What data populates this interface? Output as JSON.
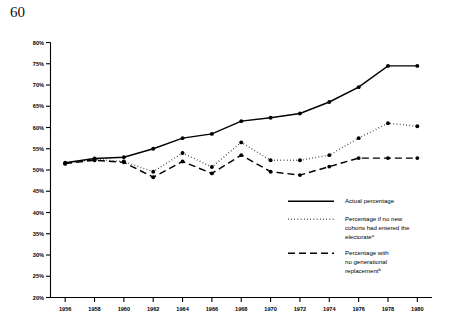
{
  "page": {
    "number": "60"
  },
  "chart_data": {
    "type": "line",
    "title": "",
    "xlabel": "",
    "ylabel": "",
    "x": [
      1956,
      1958,
      1960,
      1962,
      1964,
      1966,
      1968,
      1970,
      1972,
      1974,
      1976,
      1978,
      1980
    ],
    "categories": [
      "1956",
      "1958",
      "1960",
      "1962",
      "1964",
      "1966",
      "1968",
      "1970",
      "1972",
      "1974",
      "1976",
      "1978",
      "1980"
    ],
    "xlim": [
      1955,
      1981
    ],
    "ylim": [
      20,
      80
    ],
    "ytick_labels": [
      "20%",
      "25%",
      "30%",
      "35%",
      "40%",
      "45%",
      "50%",
      "55%",
      "60%",
      "65%",
      "70%",
      "75%",
      "80%"
    ],
    "ytick_values": [
      20,
      25,
      30,
      35,
      40,
      45,
      50,
      55,
      60,
      65,
      70,
      75,
      80
    ],
    "grid": false,
    "legend_position": "right-inside",
    "series": [
      {
        "name": "Actual percentage",
        "style": "solid",
        "values": [
          51.7,
          52.7,
          53.0,
          55.0,
          57.5,
          58.5,
          61.5,
          62.3,
          63.3,
          66.0,
          69.5,
          74.5,
          74.5
        ]
      },
      {
        "name": "Percentage if no new cohorts had entered the electorate",
        "style": "dotted",
        "footnote": "a",
        "values": [
          51.5,
          52.5,
          52.0,
          49.6,
          54.0,
          50.7,
          56.5,
          52.3,
          52.3,
          53.5,
          57.5,
          61.0,
          60.3
        ]
      },
      {
        "name": "Percentage with no generational replacement",
        "style": "dashed",
        "footnote": "b",
        "values": [
          51.5,
          52.3,
          51.8,
          48.3,
          52.0,
          49.2,
          53.5,
          49.6,
          48.8,
          50.8,
          52.8,
          52.8,
          52.8
        ]
      }
    ],
    "legend": [
      {
        "label": "Actual percentage",
        "style": "solid",
        "footnote": ""
      },
      {
        "label_line1": "Percentage if no new",
        "label_line2": "cohorts had entered the",
        "label_line3": "electorate",
        "style": "dotted",
        "footnote": "a"
      },
      {
        "label_line1": "Percentage with",
        "label_line2": "no generational",
        "label_line3": "replacement",
        "style": "dashed",
        "footnote": "b"
      }
    ]
  }
}
